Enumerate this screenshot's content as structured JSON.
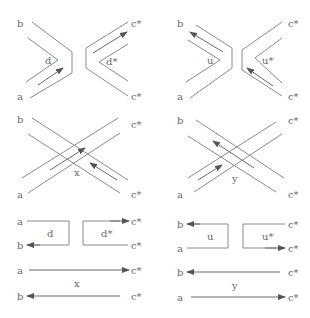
{
  "diagram": {
    "panels": [
      {
        "id": "top-left",
        "ends": {
          "tl": "b",
          "bl": "a",
          "tr": "c*",
          "br": "c*"
        },
        "inner_labels": {
          "left": "d",
          "right": "d*"
        }
      },
      {
        "id": "top-right",
        "ends": {
          "tl": "b",
          "bl": "a",
          "tr": "c*",
          "br": "c*"
        },
        "inner_labels": {
          "left": "u",
          "right": "u*"
        }
      },
      {
        "id": "mid-left",
        "ends": {
          "tl": "b",
          "bl": "a",
          "tr": "c*",
          "br": "c*"
        },
        "inner_labels": {
          "center": "x"
        }
      },
      {
        "id": "mid-right",
        "ends": {
          "tl": "b",
          "bl": "a",
          "tr": "c*",
          "br": "c*"
        },
        "inner_labels": {
          "center": "y"
        }
      },
      {
        "id": "bottom-left-split",
        "ends": {
          "tl": "a",
          "bl": "b",
          "tr": "c*",
          "br": "c*"
        },
        "inner_labels": {
          "left": "d",
          "right": "d*"
        }
      },
      {
        "id": "bottom-right-split",
        "ends": {
          "tl": "b",
          "bl": "a",
          "tr": "c*",
          "br": "c*"
        },
        "inner_labels": {
          "left": "u",
          "right": "u*"
        }
      },
      {
        "id": "bottom-left-straight",
        "ends": {
          "tl": "a",
          "bl": "b",
          "tr": "c*",
          "br": "c*"
        },
        "inner_labels": {
          "center": "x"
        }
      },
      {
        "id": "bottom-right-straight",
        "ends": {
          "tl": "b",
          "bl": "a",
          "tr": "c*",
          "br": "c*"
        },
        "inner_labels": {
          "center": "y"
        }
      }
    ]
  }
}
